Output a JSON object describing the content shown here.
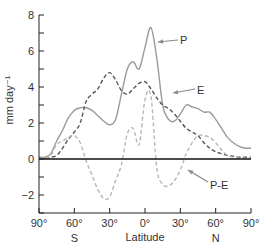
{
  "chart_data": {
    "type": "line",
    "title": "",
    "xlabel": "Latitude",
    "ylabel": "mm day⁻¹",
    "xlim": [
      -90,
      90
    ],
    "ylim": [
      -3,
      8
    ],
    "grid": false,
    "legend": "inline annotations with arrows",
    "x_ticks": [
      -90,
      -60,
      -30,
      0,
      30,
      60,
      90
    ],
    "x_tick_labels": [
      "90°",
      "60°",
      "30°",
      "0°",
      "30°",
      "60°",
      "90°"
    ],
    "hemisphere_labels": [
      {
        "text": "S",
        "lat": -60
      },
      {
        "text": "N",
        "lat": 60
      }
    ],
    "y_ticks": [
      -2,
      0,
      2,
      4,
      6,
      8
    ],
    "y_minor_ticks": [
      -3,
      -1,
      1,
      3,
      5,
      7
    ],
    "x": [
      -90,
      -85,
      -80,
      -75,
      -70,
      -65,
      -60,
      -55,
      -50,
      -45,
      -40,
      -35,
      -30,
      -25,
      -20,
      -15,
      -10,
      -5,
      0,
      5,
      10,
      15,
      20,
      25,
      30,
      35,
      40,
      45,
      50,
      55,
      60,
      65,
      70,
      75,
      80,
      85,
      90
    ],
    "series": [
      {
        "name": "P",
        "style": "solid",
        "color": "#9a9a9a",
        "values": [
          0.1,
          0.1,
          0.3,
          1.0,
          1.6,
          2.3,
          2.7,
          2.85,
          2.85,
          2.7,
          2.4,
          2.1,
          1.9,
          2.2,
          3.6,
          5.0,
          5.4,
          5.0,
          6.2,
          7.3,
          5.6,
          3.0,
          2.2,
          2.1,
          2.5,
          3.0,
          2.9,
          2.8,
          2.6,
          2.6,
          2.2,
          1.7,
          1.2,
          0.9,
          0.7,
          0.6,
          0.6
        ]
      },
      {
        "name": "E",
        "style": "dashed",
        "color": "#555555",
        "values": [
          0.05,
          0.05,
          0.1,
          0.2,
          0.6,
          1.1,
          1.5,
          2.0,
          3.2,
          3.6,
          3.9,
          4.5,
          4.8,
          4.4,
          3.8,
          3.6,
          3.9,
          4.2,
          4.3,
          3.9,
          3.4,
          3.0,
          2.8,
          2.5,
          2.1,
          1.7,
          1.5,
          1.3,
          0.9,
          0.6,
          0.4,
          0.3,
          0.2,
          0.15,
          0.1,
          0.1,
          0.1
        ]
      },
      {
        "name": "P-E",
        "style": "dashed",
        "color": "#b8b8b8",
        "values": [
          0.05,
          0.05,
          0.2,
          0.8,
          1.0,
          1.2,
          1.3,
          0.9,
          -0.1,
          -0.9,
          -1.7,
          -2.2,
          -2.1,
          -1.2,
          -0.3,
          1.4,
          1.7,
          0.8,
          3.3,
          3.5,
          -0.5,
          -1.4,
          -1.5,
          -1.2,
          -0.6,
          0.3,
          0.9,
          1.3,
          1.3,
          1.2,
          0.9,
          0.5,
          0.2,
          0.1,
          0.05,
          0.05,
          0.05
        ]
      }
    ],
    "annotations": [
      {
        "text": "P",
        "label_x": 180,
        "label_y": 44,
        "arrow_from": [
          178,
          40
        ],
        "arrow_to": [
          158,
          42
        ]
      },
      {
        "text": "E",
        "label_x": 197,
        "label_y": 94,
        "arrow_from": [
          195,
          89
        ],
        "arrow_to": [
          173,
          93
        ]
      },
      {
        "text": "P-E",
        "label_x": 210,
        "label_y": 189,
        "arrow_from": [
          208,
          182
        ],
        "arrow_to": [
          188,
          170
        ]
      }
    ]
  }
}
